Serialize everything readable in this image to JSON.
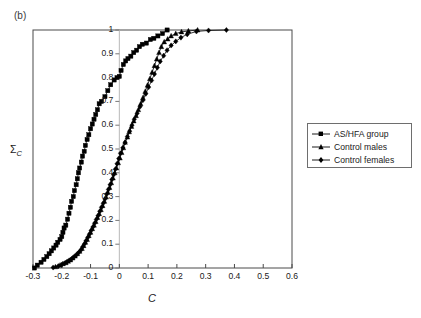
{
  "panel": {
    "label": "(b)"
  },
  "legend": {
    "position": "right-outside",
    "items": [
      {
        "label": "AS/HFA group",
        "marker": "square-marker-icon",
        "color": "#000000"
      },
      {
        "label": "Control males",
        "marker": "triangle-marker-icon",
        "color": "#000000"
      },
      {
        "label": "Control females",
        "marker": "diamond-marker-icon",
        "color": "#000000"
      }
    ]
  },
  "axes": {
    "xlabel": "C",
    "ylabel_sigma": "Σ",
    "ylabel_sub": "C",
    "xticks": [
      "-0.3",
      "-0.2",
      "-0.1",
      "0",
      "0.1",
      "0.2",
      "0.3",
      "0.4",
      "0.5",
      "0.6"
    ],
    "yticks": [
      "0",
      "0.1",
      "0.2",
      "0.3",
      "0.4",
      "0.5",
      "0.6",
      "0.7",
      "0.8",
      "0.9",
      "1"
    ]
  },
  "chart_data": {
    "type": "line",
    "title": "",
    "subtitle": "(b)",
    "xlabel": "C",
    "ylabel": "ΣC",
    "xlim": [
      -0.3,
      0.6
    ],
    "ylim": [
      0,
      1
    ],
    "xticks": [
      -0.3,
      -0.2,
      -0.1,
      0,
      0.1,
      0.2,
      0.3,
      0.4,
      0.5,
      0.6
    ],
    "yticks": [
      0,
      0.1,
      0.2,
      0.3,
      0.4,
      0.5,
      0.6,
      0.7,
      0.8,
      0.9,
      1
    ],
    "grid": false,
    "legend_position": "right outside plot",
    "note": "Cumulative distribution (empirical CDF) of C for three groups; y-axis drawn at C=0",
    "series": [
      {
        "name": "AS/HFA group",
        "marker": "square",
        "color": "#000000",
        "points": [
          [
            -0.295,
            0.0
          ],
          [
            -0.285,
            0.012
          ],
          [
            -0.272,
            0.024
          ],
          [
            -0.262,
            0.036
          ],
          [
            -0.252,
            0.048
          ],
          [
            -0.244,
            0.06
          ],
          [
            -0.236,
            0.072
          ],
          [
            -0.228,
            0.084
          ],
          [
            -0.22,
            0.096
          ],
          [
            -0.214,
            0.108
          ],
          [
            -0.206,
            0.12
          ],
          [
            -0.2,
            0.132
          ],
          [
            -0.196,
            0.15
          ],
          [
            -0.192,
            0.168
          ],
          [
            -0.186,
            0.18
          ],
          [
            -0.18,
            0.205
          ],
          [
            -0.175,
            0.23
          ],
          [
            -0.17,
            0.255
          ],
          [
            -0.166,
            0.28
          ],
          [
            -0.16,
            0.3
          ],
          [
            -0.156,
            0.325
          ],
          [
            -0.15,
            0.35
          ],
          [
            -0.146,
            0.375
          ],
          [
            -0.142,
            0.4
          ],
          [
            -0.138,
            0.42
          ],
          [
            -0.132,
            0.445
          ],
          [
            -0.128,
            0.47
          ],
          [
            -0.122,
            0.49
          ],
          [
            -0.118,
            0.515
          ],
          [
            -0.112,
            0.54
          ],
          [
            -0.106,
            0.56
          ],
          [
            -0.1,
            0.585
          ],
          [
            -0.094,
            0.605
          ],
          [
            -0.088,
            0.625
          ],
          [
            -0.082,
            0.645
          ],
          [
            -0.076,
            0.665
          ],
          [
            -0.07,
            0.69
          ],
          [
            -0.062,
            0.7
          ],
          [
            -0.05,
            0.72
          ],
          [
            -0.04,
            0.745
          ],
          [
            -0.03,
            0.77
          ],
          [
            -0.018,
            0.79
          ],
          [
            -0.008,
            0.8
          ],
          [
            0.0,
            0.805
          ],
          [
            0.006,
            0.83
          ],
          [
            0.014,
            0.855
          ],
          [
            0.022,
            0.87
          ],
          [
            0.03,
            0.88
          ],
          [
            0.04,
            0.89
          ],
          [
            0.05,
            0.905
          ],
          [
            0.06,
            0.915
          ],
          [
            0.07,
            0.93
          ],
          [
            0.08,
            0.94
          ],
          [
            0.094,
            0.945
          ],
          [
            0.108,
            0.96
          ],
          [
            0.12,
            0.965
          ],
          [
            0.134,
            0.975
          ],
          [
            0.15,
            0.985
          ],
          [
            0.166,
            1.0
          ]
        ]
      },
      {
        "name": "Control males",
        "marker": "triangle",
        "color": "#000000",
        "points": [
          [
            -0.222,
            0.005
          ],
          [
            -0.206,
            0.012
          ],
          [
            -0.196,
            0.018
          ],
          [
            -0.186,
            0.022
          ],
          [
            -0.178,
            0.028
          ],
          [
            -0.17,
            0.034
          ],
          [
            -0.162,
            0.042
          ],
          [
            -0.154,
            0.05
          ],
          [
            -0.146,
            0.06
          ],
          [
            -0.138,
            0.07
          ],
          [
            -0.13,
            0.082
          ],
          [
            -0.124,
            0.094
          ],
          [
            -0.118,
            0.108
          ],
          [
            -0.112,
            0.12
          ],
          [
            -0.106,
            0.136
          ],
          [
            -0.1,
            0.15
          ],
          [
            -0.094,
            0.165
          ],
          [
            -0.088,
            0.18
          ],
          [
            -0.082,
            0.195
          ],
          [
            -0.076,
            0.212
          ],
          [
            -0.07,
            0.228
          ],
          [
            -0.064,
            0.245
          ],
          [
            -0.058,
            0.262
          ],
          [
            -0.052,
            0.28
          ],
          [
            -0.046,
            0.298
          ],
          [
            -0.04,
            0.318
          ],
          [
            -0.034,
            0.338
          ],
          [
            -0.028,
            0.358
          ],
          [
            -0.022,
            0.378
          ],
          [
            -0.016,
            0.4
          ],
          [
            -0.01,
            0.42
          ],
          [
            -0.004,
            0.442
          ],
          [
            0.002,
            0.462
          ],
          [
            0.008,
            0.485
          ],
          [
            0.014,
            0.505
          ],
          [
            0.02,
            0.528
          ],
          [
            0.028,
            0.55
          ],
          [
            0.034,
            0.572
          ],
          [
            0.042,
            0.595
          ],
          [
            0.05,
            0.618
          ],
          [
            0.058,
            0.64
          ],
          [
            0.066,
            0.665
          ],
          [
            0.074,
            0.69
          ],
          [
            0.082,
            0.715
          ],
          [
            0.09,
            0.742
          ],
          [
            0.098,
            0.768
          ],
          [
            0.106,
            0.795
          ],
          [
            0.114,
            0.822
          ],
          [
            0.122,
            0.85
          ],
          [
            0.13,
            0.878
          ],
          [
            0.138,
            0.905
          ],
          [
            0.146,
            0.93
          ],
          [
            0.156,
            0.95
          ],
          [
            0.168,
            0.962
          ],
          [
            0.18,
            0.975
          ],
          [
            0.196,
            0.985
          ],
          [
            0.216,
            0.992
          ],
          [
            0.24,
            0.996
          ],
          [
            0.272,
            1.0
          ]
        ]
      },
      {
        "name": "Control females",
        "marker": "diamond",
        "color": "#000000",
        "points": [
          [
            -0.23,
            0.002
          ],
          [
            -0.212,
            0.008
          ],
          [
            -0.2,
            0.014
          ],
          [
            -0.19,
            0.02
          ],
          [
            -0.182,
            0.026
          ],
          [
            -0.174,
            0.032
          ],
          [
            -0.166,
            0.038
          ],
          [
            -0.158,
            0.046
          ],
          [
            -0.15,
            0.054
          ],
          [
            -0.142,
            0.064
          ],
          [
            -0.134,
            0.075
          ],
          [
            -0.128,
            0.088
          ],
          [
            -0.122,
            0.1
          ],
          [
            -0.116,
            0.114
          ],
          [
            -0.11,
            0.128
          ],
          [
            -0.104,
            0.142
          ],
          [
            -0.098,
            0.158
          ],
          [
            -0.092,
            0.172
          ],
          [
            -0.086,
            0.188
          ],
          [
            -0.08,
            0.204
          ],
          [
            -0.074,
            0.22
          ],
          [
            -0.068,
            0.238
          ],
          [
            -0.062,
            0.255
          ],
          [
            -0.056,
            0.272
          ],
          [
            -0.05,
            0.29
          ],
          [
            -0.044,
            0.31
          ],
          [
            -0.038,
            0.33
          ],
          [
            -0.032,
            0.35
          ],
          [
            -0.026,
            0.372
          ],
          [
            -0.02,
            0.392
          ],
          [
            -0.014,
            0.415
          ],
          [
            -0.008,
            0.438
          ],
          [
            -0.002,
            0.46
          ],
          [
            0.004,
            0.482
          ],
          [
            0.012,
            0.505
          ],
          [
            0.02,
            0.528
          ],
          [
            0.028,
            0.552
          ],
          [
            0.036,
            0.575
          ],
          [
            0.044,
            0.6
          ],
          [
            0.052,
            0.625
          ],
          [
            0.062,
            0.65
          ],
          [
            0.072,
            0.678
          ],
          [
            0.082,
            0.705
          ],
          [
            0.092,
            0.732
          ],
          [
            0.102,
            0.76
          ],
          [
            0.112,
            0.788
          ],
          [
            0.122,
            0.815
          ],
          [
            0.132,
            0.842
          ],
          [
            0.142,
            0.868
          ],
          [
            0.154,
            0.892
          ],
          [
            0.166,
            0.915
          ],
          [
            0.18,
            0.935
          ],
          [
            0.196,
            0.952
          ],
          [
            0.214,
            0.968
          ],
          [
            0.236,
            0.982
          ],
          [
            0.268,
            0.994
          ],
          [
            0.31,
            0.998
          ],
          [
            0.372,
            1.0
          ]
        ]
      }
    ]
  }
}
